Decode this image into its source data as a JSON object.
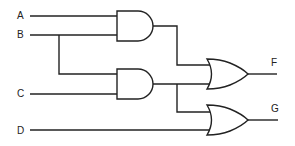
{
  "diagram": {
    "type": "logic-circuit",
    "inputs": [
      {
        "label": "A",
        "x": 20,
        "y": 15,
        "line_y": 16
      },
      {
        "label": "B",
        "x": 20,
        "y": 33,
        "line_y": 35
      },
      {
        "label": "C",
        "x": 20,
        "y": 93,
        "line_y": 94
      },
      {
        "label": "D",
        "x": 20,
        "y": 130,
        "line_y": 130
      }
    ],
    "outputs": [
      {
        "label": "F",
        "x": 274,
        "y": 63
      },
      {
        "label": "G",
        "x": 274,
        "y": 109
      }
    ],
    "gates": [
      {
        "id": "and1",
        "type": "AND",
        "inputs": [
          "A",
          "B"
        ]
      },
      {
        "id": "and2",
        "type": "AND",
        "inputs": [
          "B",
          "C"
        ]
      },
      {
        "id": "or1",
        "type": "OR",
        "inputs": [
          "and1",
          "and2"
        ],
        "output": "F"
      },
      {
        "id": "or2",
        "type": "OR",
        "inputs": [
          "and2",
          "D"
        ],
        "output": "G"
      }
    ],
    "colors": {
      "stroke": "#222222",
      "background": "#ffffff"
    }
  }
}
